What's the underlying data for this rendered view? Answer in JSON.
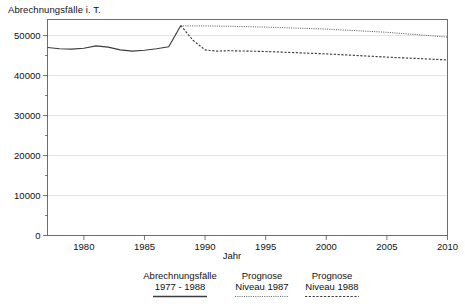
{
  "chart_data": {
    "type": "line",
    "title": "Abrechnungsfälle i. T.",
    "xlabel": "Jahr",
    "ylabel": "Abrechnungsfälle i. T.",
    "xlim": [
      1977,
      2010
    ],
    "ylim": [
      0,
      54000
    ],
    "grid": true,
    "legend_position": "bottom",
    "xticks": [
      "1980",
      "1985",
      "1990",
      "1995",
      "2000",
      "2005",
      "2010"
    ],
    "xtick_values": [
      1980,
      1985,
      1990,
      1995,
      2000,
      2005,
      2010
    ],
    "yticks": [
      "0",
      "10000",
      "20000",
      "30000",
      "40000",
      "50000"
    ],
    "ytick_values": [
      0,
      10000,
      20000,
      30000,
      40000,
      50000
    ],
    "yminor_values": [
      5000,
      15000,
      25000,
      35000,
      45000
    ],
    "series": [
      {
        "name": "Abrechnungsfälle 1977 - 1988",
        "style": "solid",
        "x": [
          1977,
          1978,
          1979,
          1980,
          1981,
          1982,
          1983,
          1984,
          1985,
          1986,
          1987,
          1988
        ],
        "values": [
          47000,
          46700,
          46600,
          46800,
          47400,
          47100,
          46400,
          46100,
          46300,
          46700,
          47200,
          52500
        ]
      },
      {
        "name": "Prognose Niveau 1987",
        "style": "dashed",
        "x": [
          1988,
          1989,
          1990,
          1991,
          1992,
          1995,
          2000,
          2005,
          2010
        ],
        "values": [
          52500,
          48800,
          46400,
          46100,
          46200,
          46000,
          45400,
          44600,
          43900
        ]
      },
      {
        "name": "Prognose Niveau 1988",
        "style": "dotted",
        "x": [
          1988,
          1990,
          1992,
          1995,
          2000,
          2005,
          2010
        ],
        "values": [
          52400,
          52400,
          52300,
          52100,
          51600,
          50800,
          49600
        ]
      }
    ]
  },
  "legend": {
    "entries": [
      {
        "line1": "Abrechnungsfälle",
        "line2": "1977 - 1988",
        "style": "solid"
      },
      {
        "line1": "Prognose",
        "line2": "Niveau 1987",
        "style": "dotted-fine"
      },
      {
        "line1": "Prognose",
        "line2": "Niveau 1988",
        "style": "dotted-sparse"
      }
    ]
  }
}
